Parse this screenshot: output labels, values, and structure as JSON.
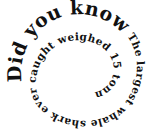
{
  "spiral_text": {
    "part1": "Did you know?",
    "part2": "The largest whale shark ever caught weighed 15 tonnes."
  }
}
